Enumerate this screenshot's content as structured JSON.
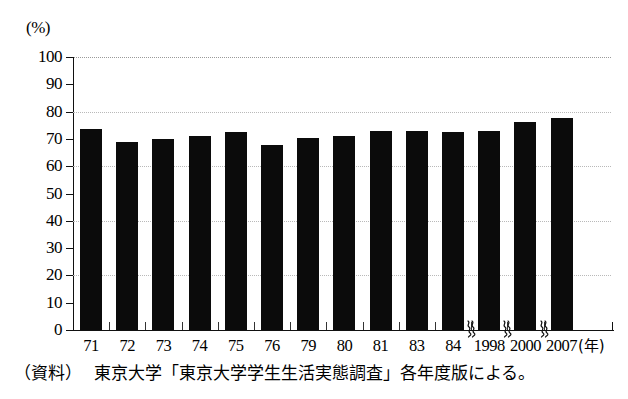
{
  "axis": {
    "unit_label": "(%)",
    "y_ticks": [
      0,
      10,
      20,
      30,
      40,
      50,
      60,
      70,
      80,
      90,
      100
    ],
    "x_unit_label": "(年)"
  },
  "source_note": {
    "tag": "（資料）",
    "text": "東京大学「東京大学学生生活実態調査」各年度版による。"
  },
  "icons": {
    "axis_break": "axis-break-squiggle"
  },
  "chart_data": {
    "type": "bar",
    "title": "",
    "subtitle": "",
    "xlabel": "(年)",
    "ylabel": "(%)",
    "ylim": [
      0,
      100
    ],
    "ytick_step": 10,
    "grid": true,
    "grid_lines_at": [
      20,
      40,
      60,
      80,
      100
    ],
    "legend": null,
    "bar_color": "#0b0b0b",
    "categories": [
      "71",
      "72",
      "73",
      "74",
      "75",
      "76",
      "79",
      "80",
      "81",
      "83",
      "84",
      "1998",
      "2000",
      "2007"
    ],
    "values": [
      73.5,
      68.8,
      70.0,
      71.0,
      72.5,
      67.8,
      70.5,
      71.0,
      73.0,
      73.0,
      72.5,
      73.0,
      76.3,
      77.5
    ],
    "axis_breaks_after": [
      "84",
      "1998",
      "2000"
    ],
    "annotations": []
  }
}
